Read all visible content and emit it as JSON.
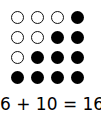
{
  "diagram": {
    "grid": {
      "rows": 4,
      "cols": 4,
      "cells": [
        [
          "empty",
          "empty",
          "empty",
          "filled"
        ],
        [
          "empty",
          "empty",
          "filled",
          "filled"
        ],
        [
          "empty",
          "filled",
          "filled",
          "filled"
        ],
        [
          "filled",
          "filled",
          "filled",
          "filled"
        ]
      ],
      "empty_count": 6,
      "filled_count": 10
    },
    "equation": "6 + 10 = 16"
  }
}
